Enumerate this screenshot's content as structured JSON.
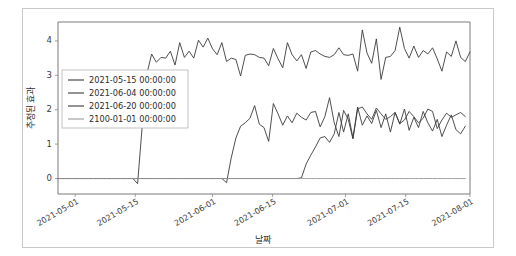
{
  "figure": {
    "background_color": "#ffffff",
    "frame_color": "#c9c9c9"
  },
  "chart_data": {
    "type": "line",
    "title": "",
    "xlabel": "날짜",
    "ylabel": "추정된 효과",
    "grid": false,
    "legend_position": "center-left",
    "ylim": [
      -0.45,
      4.55
    ],
    "yticks": [
      0,
      1,
      2,
      3,
      4
    ],
    "ytick_labels": [
      "0",
      "1",
      "2",
      "3",
      "4"
    ],
    "xlim": [
      "2021-04-27",
      "2021-08-02"
    ],
    "xtick_labels": [
      "2021-05-01",
      "2021-05-15",
      "2021-06-01",
      "2021-06-15",
      "2021-07-01",
      "2021-07-15",
      "2021-08-01"
    ],
    "xtick_positions": [
      0.0417,
      0.1875,
      0.375,
      0.5208,
      0.6979,
      0.8438,
      1.0
    ],
    "series": [
      {
        "name": "2021-05-15 00:00:00",
        "color": "#3b3b3b",
        "width": 0.9,
        "values": [
          0,
          0,
          0,
          0,
          0,
          0,
          0,
          0,
          0,
          0,
          0,
          0,
          0,
          0,
          0,
          0,
          0,
          -0.15,
          1.55,
          3.05,
          3.62,
          3.38,
          3.52,
          3.5,
          3.7,
          3.3,
          3.95,
          3.52,
          3.7,
          3.5,
          4.02,
          3.82,
          4.08,
          3.77,
          3.6,
          3.95,
          3.4,
          3.5,
          3.46,
          2.98,
          3.58,
          3.62,
          3.6,
          3.52,
          3.5,
          3.28,
          3.78,
          3.48,
          3.22,
          3.95,
          3.6,
          3.42,
          3.6,
          3.2,
          3.68,
          3.72,
          3.62,
          3.55,
          3.52,
          3.6,
          3.8,
          3.6,
          3.58,
          3.62,
          3.12,
          4.32,
          3.65,
          3.35,
          4.06,
          2.88,
          3.52,
          3.55,
          3.72,
          4.4,
          3.78,
          3.5,
          3.85,
          3.52,
          3.72,
          3.62,
          3.8,
          3.48,
          3.12,
          3.68,
          3.55,
          4.0,
          3.52,
          3.4,
          3.68
        ]
      },
      {
        "name": "2021-06-04 00:00:00",
        "color": "#3b3b3b",
        "width": 0.9,
        "values": [
          0,
          0,
          0,
          0,
          0,
          0,
          0,
          0,
          0,
          0,
          0,
          0,
          0,
          0,
          0,
          0,
          0,
          0,
          0,
          0,
          0,
          0,
          0,
          0,
          0,
          0,
          0,
          0,
          0,
          0,
          0,
          0,
          0,
          0,
          0,
          0,
          -0.12,
          0.6,
          1.18,
          1.52,
          1.62,
          1.75,
          2.12,
          1.58,
          1.48,
          1.08,
          2.18,
          1.88,
          1.55,
          1.82,
          1.62,
          1.9,
          1.78,
          1.7,
          1.92,
          1.95,
          1.5,
          1.8,
          2.35,
          1.62,
          1.22,
          1.98,
          1.72,
          1.15,
          2.02,
          2.08,
          1.88,
          1.72,
          2.05,
          1.88,
          1.72,
          1.8,
          1.92,
          1.6,
          1.7,
          1.95,
          1.8,
          1.62,
          1.75,
          2.02,
          1.95,
          1.45,
          1.7,
          1.9,
          1.78,
          1.85,
          1.92,
          1.8
        ]
      },
      {
        "name": "2021-06-20 00:00:00",
        "color": "#3b3b3b",
        "width": 0.9,
        "values": [
          0,
          0,
          0,
          0,
          0,
          0,
          0,
          0,
          0,
          0,
          0,
          0,
          0,
          0,
          0,
          0,
          0,
          0,
          0,
          0,
          0,
          0,
          0,
          0,
          0,
          0,
          0,
          0,
          0,
          0,
          0,
          0,
          0,
          0,
          0,
          0,
          0,
          0,
          0,
          0,
          0,
          0,
          0,
          0,
          0,
          0,
          0,
          0,
          0,
          0,
          0,
          0,
          0.02,
          0.42,
          0.68,
          0.92,
          1.18,
          1.22,
          1.05,
          1.3,
          1.92,
          1.35,
          1.88,
          1.18,
          2.08,
          1.55,
          1.82,
          1.6,
          1.98,
          1.48,
          1.88,
          1.35,
          1.92,
          1.58,
          2.02,
          1.4,
          1.78,
          1.48,
          1.95,
          1.62,
          1.38,
          1.72,
          1.22,
          1.55,
          1.85,
          1.42,
          1.3,
          1.52
        ]
      },
      {
        "name": "2100-01-01 00:00:00",
        "color": "#9a9a9a",
        "width": 0.9,
        "values": [
          0,
          0,
          0,
          0,
          0,
          0,
          0,
          0,
          0,
          0,
          0,
          0,
          0,
          0,
          0,
          0,
          0,
          0,
          0,
          0,
          0,
          0,
          0,
          0,
          0,
          0,
          0,
          0,
          0,
          0,
          0,
          0,
          0,
          0,
          0,
          0,
          0,
          0,
          0,
          0,
          0,
          0,
          0,
          0,
          0,
          0,
          0,
          0,
          0,
          0,
          0,
          0,
          0,
          0,
          0,
          0,
          0,
          0,
          0,
          0,
          0,
          0,
          0,
          0,
          0,
          0,
          0,
          0,
          0,
          0,
          0,
          0,
          0,
          0,
          0,
          0,
          0,
          0,
          0,
          0,
          0,
          0,
          0,
          0,
          0,
          0,
          0,
          0
        ]
      }
    ]
  },
  "legend": {
    "entries": [
      "2021-05-15 00:00:00",
      "2021-06-04 00:00:00",
      "2021-06-20 00:00:00",
      "2100-01-01 00:00:00"
    ]
  }
}
